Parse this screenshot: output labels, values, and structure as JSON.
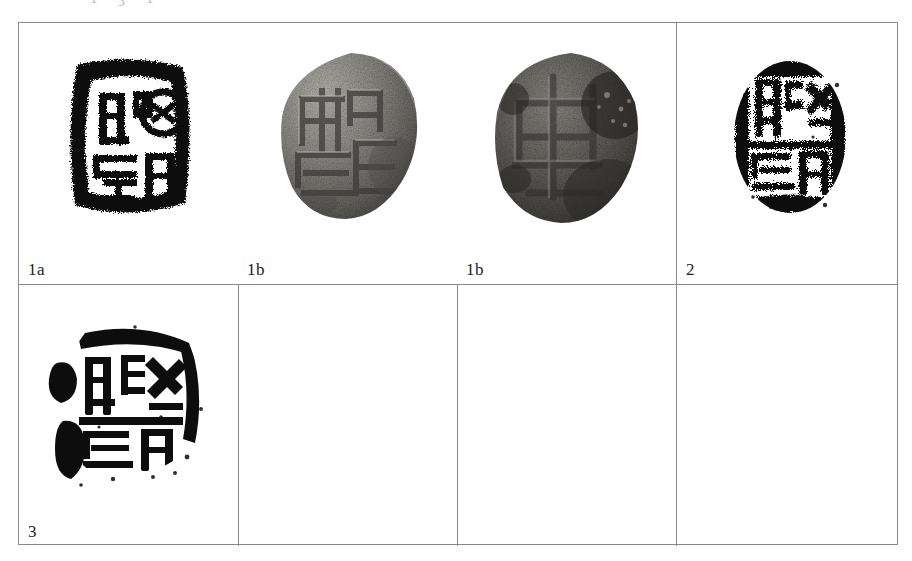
{
  "page": {
    "width": 912,
    "height": 561,
    "background": "#ffffff",
    "type": "scanned-plate"
  },
  "top_cut_text": {
    "description": "partially cropped line of text at the very top edge of the scan",
    "fragments": [
      "·",
      "1",
      "ʒ",
      "1"
    ]
  },
  "plate": {
    "border_color": "#8a8a8e",
    "rows": [
      {
        "name": "top-row",
        "cells": [
          {
            "label": "1a",
            "figure": "seal-rubbing-1a",
            "caption_position": "bottom-left"
          },
          {
            "label": "1b",
            "figure": "seal-photo-1b-front",
            "caption_position": "bottom-left"
          },
          {
            "label": "1b",
            "figure": "seal-photo-1b-angled",
            "caption_position": "bottom-left"
          },
          {
            "label": "2",
            "figure": "seal-rubbing-2",
            "caption_position": "bottom-left"
          }
        ]
      },
      {
        "name": "bottom-row",
        "cells": [
          {
            "label": "3",
            "figure": "seal-rubbing-3",
            "caption_position": "bottom-left"
          },
          {
            "label": "",
            "figure": "",
            "caption_position": "bottom-left"
          },
          {
            "label": "",
            "figure": "",
            "caption_position": "bottom-left"
          },
          {
            "label": "",
            "figure": "",
            "caption_position": "bottom-left"
          }
        ]
      }
    ]
  },
  "figures": {
    "seal_rubbing_1a": {
      "name": "seal-rubbing-1a",
      "medium": "ink rubbing / impression",
      "tone": "black on white",
      "shape": "roughly square seal face with heavy irregular border",
      "ink_color": "#0d0d0d"
    },
    "seal_photo_1b_front": {
      "name": "seal-photo-1b-front",
      "medium": "grayscale photograph",
      "tone": "mid-gray, lit from upper left",
      "shape": "round seal face, incised characters",
      "base_color": "#8d8d8d"
    },
    "seal_photo_1b_angled": {
      "name": "seal-photo-1b-angled",
      "medium": "grayscale photograph",
      "tone": "dark gray, lower contrast",
      "shape": "round seal face seen at an angle",
      "base_color": "#5c5c5c"
    },
    "seal_rubbing_2": {
      "name": "seal-rubbing-2",
      "medium": "ink rubbing / impression",
      "tone": "black, heavily speckled",
      "shape": "oval seal face",
      "ink_color": "#0d0d0d"
    },
    "seal_rubbing_3": {
      "name": "seal-rubbing-3",
      "medium": "ink rubbing / impression",
      "tone": "black, speckled with solid blot at left",
      "shape": "irregular round seal face",
      "ink_color": "#0d0d0d"
    }
  }
}
